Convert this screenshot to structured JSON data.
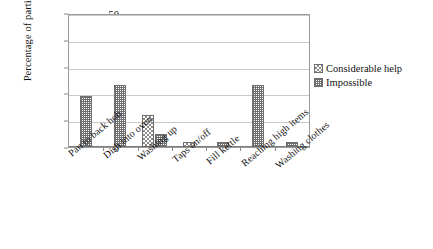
{
  "chart_data": {
    "type": "bar",
    "title": "",
    "xlabel": "",
    "ylabel": "Percentage of participants",
    "ylim": [
      0,
      50
    ],
    "yticks": [
      0,
      10,
      20,
      30,
      40,
      50
    ],
    "grid": true,
    "legend_position": "right",
    "categories": [
      "Pan to back hob",
      "Dish into oven",
      "Washing up",
      "Taps on/off",
      "Fill kettle",
      "Reaching high items",
      "Washing clothes"
    ],
    "series": [
      {
        "name": "Considerable help",
        "pattern": "checkerboard",
        "color": "#8c8c8c",
        "values": [
          0,
          0,
          12,
          2,
          0,
          0,
          0
        ]
      },
      {
        "name": "Impossible",
        "pattern": "dense-grid",
        "color": "#6f6f6f",
        "values": [
          19,
          23,
          5,
          0,
          2,
          23,
          2
        ]
      }
    ]
  },
  "axes": {
    "y_title": "Percentage of participants",
    "tick_labels": [
      "50",
      "40",
      "30",
      "20",
      "10",
      "0"
    ]
  },
  "legend": {
    "items": [
      {
        "label": "Considerable help"
      },
      {
        "label": "Impossible"
      }
    ]
  },
  "colors": {
    "frame": "#9a9a9a",
    "gridline": "#c9c9c9",
    "bar_border": "#6e6e6e",
    "background": "#ffffff"
  }
}
